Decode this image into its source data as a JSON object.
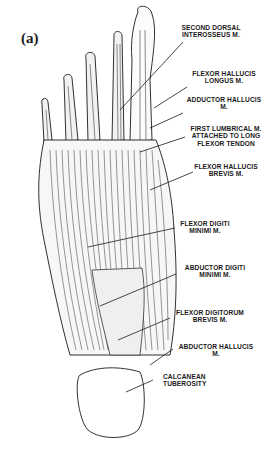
{
  "figure": {
    "panel_label": "(a)",
    "colors": {
      "ink": "#1a1a1a",
      "background": "#ffffff"
    }
  },
  "labels": [
    {
      "id": "second-dorsal-interosseus",
      "lines": [
        "SECOND DORSAL",
        "INTEROSSEUS M."
      ]
    },
    {
      "id": "flexor-hallucis-longus",
      "lines": [
        "FLEXOR HALLUCIS",
        "LONGUS M."
      ]
    },
    {
      "id": "adductor-hallucis",
      "lines": [
        "ADDUCTOR HALLUCIS",
        "M."
      ]
    },
    {
      "id": "first-lumbrical",
      "lines": [
        "FIRST LUMBRICAL M.",
        "ATTACHED TO LONG",
        "FLEXOR TENDON"
      ]
    },
    {
      "id": "flexor-hallucis-brevis",
      "lines": [
        "FLEXOR HALLUCIS",
        "BREVIS M."
      ]
    },
    {
      "id": "flexor-digiti-minimi",
      "lines": [
        "FLEXOR DIGITI",
        "MINIMI M."
      ]
    },
    {
      "id": "abductor-digiti-minimi",
      "lines": [
        "ABDUCTOR DIGITI",
        "MINIMI M."
      ]
    },
    {
      "id": "flexor-digitorum-brevis",
      "lines": [
        "FLEXOR DIGITORUM",
        "BREVIS M."
      ]
    },
    {
      "id": "abductor-hallucis",
      "lines": [
        "ABDUCTOR HALLUCIS",
        "M."
      ]
    },
    {
      "id": "calcanean-tuberosity",
      "lines": [
        "CALCANEAN",
        "TUBEROSITY"
      ]
    }
  ]
}
